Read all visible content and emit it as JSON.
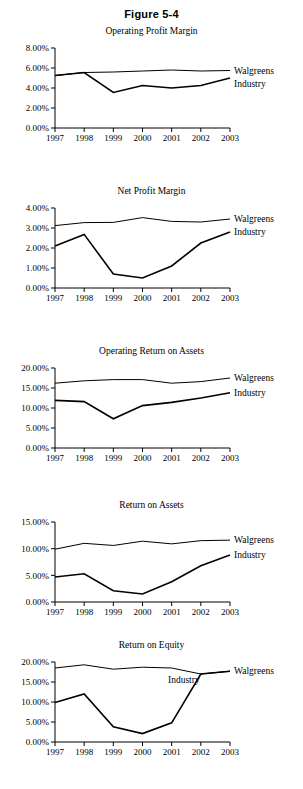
{
  "figure": {
    "label": "Figure 5-4"
  },
  "series_names": {
    "walgreens": "Walgreens",
    "industry": "Industry"
  },
  "charts": [
    {
      "id": "operating-profit-margin",
      "chart_data": {
        "type": "line",
        "title": "Operating Profit Margin",
        "xlabel": "",
        "ylabel": "",
        "grid": false,
        "legend_position": "right-inline",
        "categories": [
          "1997",
          "1998",
          "1999",
          "2000",
          "2001",
          "2002",
          "2003"
        ],
        "ylim": [
          0,
          8
        ],
        "yticks": [
          0,
          2,
          4,
          6,
          8
        ],
        "ytick_labels": [
          "0.00%",
          "2.00%",
          "4.00%",
          "6.00%",
          "8.00%"
        ],
        "series": [
          {
            "name": "Walgreens",
            "values": [
              5.25,
              5.55,
              5.6,
              5.7,
              5.8,
              5.7,
              5.75
            ]
          },
          {
            "name": "Industry",
            "values": [
              5.25,
              5.55,
              3.55,
              4.25,
              4.0,
              4.25,
              5.0
            ]
          }
        ]
      }
    },
    {
      "id": "net-profit-margin",
      "chart_data": {
        "type": "line",
        "title": "Net Profit Margin",
        "xlabel": "",
        "ylabel": "",
        "grid": false,
        "legend_position": "right-inline",
        "categories": [
          "1997",
          "1998",
          "1999",
          "2000",
          "2001",
          "2002",
          "2003"
        ],
        "ylim": [
          0,
          4
        ],
        "yticks": [
          0,
          1,
          2,
          3,
          4
        ],
        "ytick_labels": [
          "0.00%",
          "1.00%",
          "2.00%",
          "3.00%",
          "4.00%"
        ],
        "series": [
          {
            "name": "Walgreens",
            "values": [
              3.12,
              3.27,
              3.28,
              3.52,
              3.33,
              3.3,
              3.45
            ]
          },
          {
            "name": "Industry",
            "values": [
              2.1,
              2.68,
              0.7,
              0.5,
              1.1,
              2.25,
              2.8
            ]
          }
        ]
      }
    },
    {
      "id": "operating-return-on-assets",
      "chart_data": {
        "type": "line",
        "title": "Operating Return on Assets",
        "xlabel": "",
        "ylabel": "",
        "grid": false,
        "legend_position": "right-inline",
        "categories": [
          "1997",
          "1998",
          "1999",
          "2000",
          "2001",
          "2002",
          "2003"
        ],
        "ylim": [
          0,
          20
        ],
        "yticks": [
          0,
          5,
          10,
          15,
          20
        ],
        "ytick_labels": [
          "0.00%",
          "5.00%",
          "10.00%",
          "15.00%",
          "20.00%"
        ],
        "series": [
          {
            "name": "Walgreens",
            "values": [
              16.2,
              16.8,
              17.1,
              17.1,
              16.2,
              16.6,
              17.5
            ]
          },
          {
            "name": "Industry",
            "values": [
              11.9,
              11.6,
              7.3,
              10.6,
              11.4,
              12.5,
              13.8
            ]
          }
        ]
      }
    },
    {
      "id": "return-on-assets",
      "chart_data": {
        "type": "line",
        "title": "Return on Assets",
        "xlabel": "",
        "ylabel": "",
        "grid": false,
        "legend_position": "right-inline",
        "categories": [
          "1997",
          "1998",
          "1999",
          "2000",
          "2001",
          "2002",
          "2003"
        ],
        "ylim": [
          0,
          15
        ],
        "yticks": [
          0,
          5,
          10,
          15
        ],
        "ytick_labels": [
          "0.00%",
          "5.00%",
          "10.00%",
          "15.00%"
        ],
        "series": [
          {
            "name": "Walgreens",
            "values": [
              9.9,
              11.0,
              10.6,
              11.4,
              10.9,
              11.5,
              11.6
            ]
          },
          {
            "name": "Industry",
            "values": [
              4.7,
              5.3,
              2.1,
              1.5,
              3.8,
              6.8,
              8.8
            ]
          }
        ]
      }
    },
    {
      "id": "return-on-equity",
      "chart_data": {
        "type": "line",
        "title": "Return on Equity",
        "xlabel": "",
        "ylabel": "",
        "grid": false,
        "legend_position": "inside-right",
        "categories": [
          "1997",
          "1998",
          "1999",
          "2000",
          "2001",
          "2002",
          "2003"
        ],
        "ylim": [
          0,
          20
        ],
        "yticks": [
          0,
          5,
          10,
          15,
          20
        ],
        "ytick_labels": [
          "0.00%",
          "5.00%",
          "10.00%",
          "15.00%",
          "20.00%"
        ],
        "series": [
          {
            "name": "Walgreens",
            "values": [
              18.5,
              19.3,
              18.2,
              18.7,
              18.5,
              17.0,
              17.7
            ]
          },
          {
            "name": "Industry",
            "values": [
              9.9,
              12.0,
              3.8,
              2.1,
              4.8,
              17.0,
              17.7
            ]
          }
        ]
      }
    }
  ]
}
